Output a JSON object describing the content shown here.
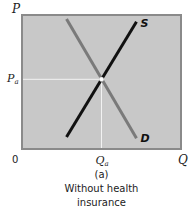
{
  "chart_data": {
    "type": "line",
    "title": "Without health insurance",
    "panel_label": "(a)",
    "caption_lines": [
      "(a)",
      "Without health",
      "insurance"
    ],
    "xlabel": "Q",
    "ylabel": "P",
    "origin_label": "0",
    "xlim": [
      0,
      10
    ],
    "ylim": [
      0,
      10
    ],
    "grid": false,
    "series": [
      {
        "name": "S",
        "label": "S",
        "color": "#111111",
        "points": [
          [
            2.8,
            0.9
          ],
          [
            7.2,
            9.5
          ]
        ]
      },
      {
        "name": "D",
        "label": "D",
        "color": "#7a7a7a",
        "points": [
          [
            2.8,
            9.7
          ],
          [
            7.2,
            0.8
          ]
        ]
      }
    ],
    "equilibrium": {
      "x": 5.0,
      "y": 5.2,
      "x_label": "Qa",
      "y_label": "Pa",
      "x_label_main": "Q",
      "x_label_sub": "a",
      "y_label_main": "P",
      "y_label_sub": "a"
    },
    "colors": {
      "plot_background": "#c8c8c8",
      "plot_border": "#8a8a8a",
      "guide_lines": "#f2f2f2",
      "supply": "#111111",
      "demand": "#7a7a7a"
    }
  }
}
